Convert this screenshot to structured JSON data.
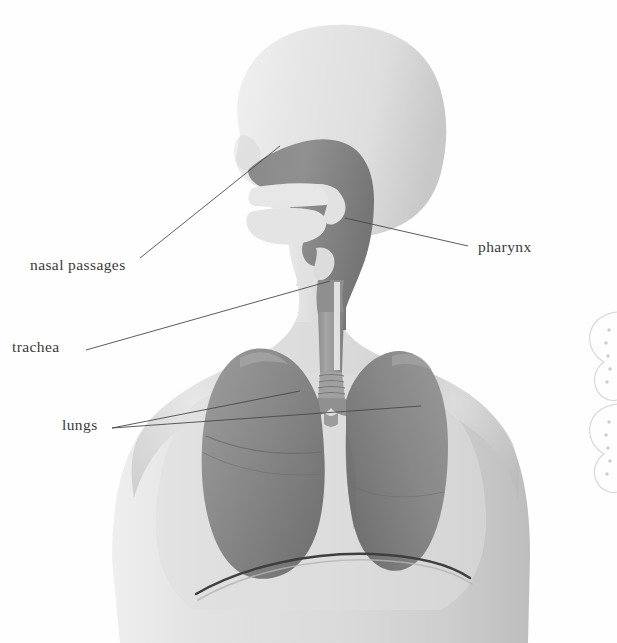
{
  "figure": {
    "background_color": "#fefefe",
    "width": 617,
    "height": 643
  },
  "palette": {
    "body_light": "#e3e3e3",
    "body_mid": "#d5d5d5",
    "body_shadow": "#bfbfbf",
    "head_light": "#e6e6e6",
    "airway_dark": "#8e8e8e",
    "airway_darker": "#7a7a7a",
    "lung_gray": "#8d8d8d",
    "lung_shadow": "#767676",
    "trachea_gray": "#9a9a9a",
    "outline": "#4a4a4a",
    "label_color": "#3a3a3a",
    "decor_outline": "#c9c9c9"
  },
  "labels": [
    {
      "id": "nasal-passages",
      "text": "nasal passages",
      "text_x": 30,
      "text_y": 270,
      "anchor": "start",
      "leader": {
        "x1": 140,
        "y1": 258,
        "x2": 280,
        "y2": 146
      }
    },
    {
      "id": "pharynx",
      "text": "pharynx",
      "text_x": 478,
      "text_y": 252,
      "anchor": "start",
      "leader": {
        "x1": 468,
        "y1": 246,
        "x2": 345,
        "y2": 218
      }
    },
    {
      "id": "trachea",
      "text": "trachea",
      "text_x": 12,
      "text_y": 352,
      "anchor": "start",
      "leader": {
        "x1": 86,
        "y1": 350,
        "x2": 330,
        "y2": 281
      }
    },
    {
      "id": "lungs",
      "text": "lungs",
      "text_x": 62,
      "text_y": 430,
      "anchor": "start",
      "leaders": [
        {
          "x1": 112,
          "y1": 428,
          "x2": 300,
          "y2": 391
        },
        {
          "x1": 112,
          "y1": 428,
          "x2": 421,
          "y2": 406
        }
      ]
    }
  ],
  "anatomy": {
    "parts": [
      {
        "name": "head-profile",
        "description": "Side view of human head facing left"
      },
      {
        "name": "nasal-cavity",
        "description": "Dark shaded nasal passage behind the nose"
      },
      {
        "name": "hard-palate",
        "description": "Pale curved shelf separating nasal cavity from mouth"
      },
      {
        "name": "tongue",
        "description": "Pale mass in the oral cavity"
      },
      {
        "name": "pharynx",
        "description": "Dark vertical throat passage behind the tongue"
      },
      {
        "name": "epiglottis",
        "description": "Small flap above the larynx"
      },
      {
        "name": "larynx",
        "description": "Voice box at the top of the trachea"
      },
      {
        "name": "trachea",
        "description": "Windpipe with cartilage rings descending into the chest"
      },
      {
        "name": "bronchi",
        "description": "Left and right primary branches from the trachea"
      },
      {
        "name": "left-lung",
        "description": "Viewer-left lung with horizontal and oblique fissures"
      },
      {
        "name": "right-lung",
        "description": "Viewer-right lung"
      },
      {
        "name": "diaphragm",
        "description": "Dark curved line beneath the lungs"
      },
      {
        "name": "torso",
        "description": "Neck, shoulders and upper chest silhouette"
      }
    ]
  },
  "decorations": {
    "right_edge_shapes": [
      {
        "name": "decor-shape-upper",
        "cx": 612,
        "cy": 355,
        "dots": 5
      },
      {
        "name": "decor-shape-lower",
        "cx": 612,
        "cy": 440,
        "dots": 5
      }
    ]
  }
}
